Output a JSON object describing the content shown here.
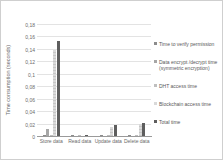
{
  "chart_data": {
    "type": "bar",
    "title": "",
    "xlabel": "",
    "ylabel": "Time consumption (seconds)",
    "ylim": [
      0,
      0.18
    ],
    "ytick_step": 0.02,
    "ytick_labels": [
      "0",
      "0,02",
      "0,04",
      "0,06",
      "0,08",
      "0,1",
      "0,12",
      "0,14",
      "0,16",
      "0,18"
    ],
    "grid": true,
    "legend_position": "right",
    "categories": [
      "Store data",
      "Read data",
      "Update data",
      "Delete data"
    ],
    "series": [
      {
        "name": "Time to verify permission",
        "color": "#8c8c8c",
        "values": [
          0.001,
          0.001,
          0.001,
          0.001
        ]
      },
      {
        "name": "Data encrypt /decrypt time (symmetric encryption)",
        "color": "#a6a6a6",
        "values": [
          0.012,
          0.0005,
          0.0005,
          0.0005
        ]
      },
      {
        "name": "DHT access time",
        "color": "#bfbfbf",
        "values": [
          0.001,
          0.001,
          0.001,
          0.001
        ]
      },
      {
        "name": "Blockchain access time",
        "color": "#d9d9d9",
        "stripe_color": "#c6c6c6",
        "values": [
          0.138,
          0.0005,
          0.015,
          0.02
        ]
      },
      {
        "name": "Total time",
        "color": "#5e5e5e",
        "values": [
          0.153,
          0.002,
          0.017,
          0.021
        ]
      }
    ]
  },
  "colors": {
    "gridline": "#e3e3e3",
    "axis": "#9a9a9a",
    "text": "#6b6b6b",
    "frame": "#cfcfcf"
  }
}
